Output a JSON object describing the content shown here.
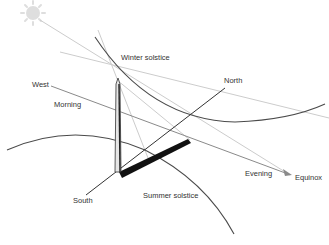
{
  "diagram": {
    "type": "sun-path-obelisk-sundial",
    "labels": {
      "winter_solstice": "Winter solstice",
      "summer_solstice": "Summer solstice",
      "equinox": "Equinox",
      "north": "North",
      "south": "South",
      "west": "West",
      "morning": "Morning",
      "evening": "Evening"
    },
    "elements": [
      {
        "name": "sun",
        "description": "Pale sun symbol in upper left"
      },
      {
        "name": "obelisk",
        "description": "Vertical obelisk acting as gnomon"
      },
      {
        "name": "shadow",
        "description": "Thick black shadow cast by obelisk toward northeast"
      },
      {
        "name": "winter-solstice-arc",
        "description": "Sun path arc for winter solstice"
      },
      {
        "name": "summer-solstice-arc",
        "description": "Sun path arc for summer solstice"
      },
      {
        "name": "equinox-line",
        "description": "Straight equinox path from West (morning) to Equinox arrow (evening)"
      },
      {
        "name": "north-south-line",
        "description": "Meridian line from South to North"
      },
      {
        "name": "sun-rays",
        "description": "Faint gray rays from sun passing obelisk tip"
      }
    ],
    "colors": {
      "arc": "#4a4a4a",
      "meridian": "#333333",
      "equinox_line": "#8a8a8a",
      "rays": "#c8c8c8",
      "shadow": "#111111",
      "sun": "#dcdcdc",
      "text": "#333333"
    }
  }
}
